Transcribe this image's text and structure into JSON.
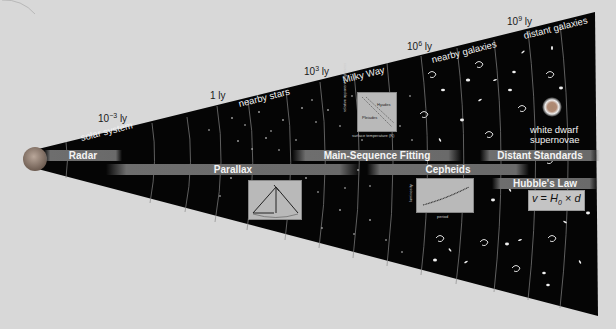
{
  "distance_markers": [
    {
      "base": "10",
      "exp": "−3",
      "unit": "ly"
    },
    {
      "base": "1",
      "exp": "",
      "unit": "ly"
    },
    {
      "base": "10",
      "exp": "3",
      "unit": "ly"
    },
    {
      "base": "10",
      "exp": "6",
      "unit": "ly"
    },
    {
      "base": "10",
      "exp": "9",
      "unit": "ly"
    }
  ],
  "regions": [
    "solar system",
    "nearby stars",
    "Milky Way",
    "nearby galaxies",
    "distant galaxies"
  ],
  "methods": {
    "radar": "Radar",
    "parallax": "Parallax",
    "main_sequence": "Main-Sequence Fitting",
    "cepheids": "Cepheids",
    "distant_standards": "Distant Standards",
    "hubble": "Hubble's Law"
  },
  "insets": {
    "hr_diagram": {
      "ylabel": "relative apparent brightness",
      "xlabel": "surface temperature (K)",
      "labels": [
        "Hyades",
        "Pleiades"
      ]
    },
    "cepheid_plot": {
      "ylabel": "luminosity",
      "xlabel": "period"
    }
  },
  "formula": {
    "v": "v",
    "eq": " = ",
    "H": "H",
    "sub": "0",
    "times": " × ",
    "d": "d"
  },
  "white_dwarf": {
    "line1": "white dwarf",
    "line2": "supernovae"
  },
  "colors": {
    "background": "#d8d8d8",
    "cone": "#050505",
    "bar": "#6c6c6c",
    "inset": "#b9b9b9"
  }
}
